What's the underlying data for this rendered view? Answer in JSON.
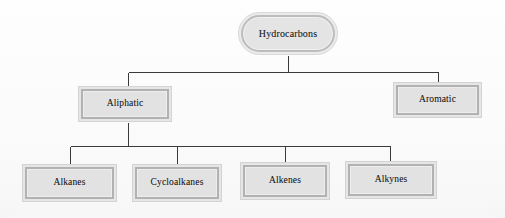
{
  "diagram": {
    "type": "tree",
    "colors": {
      "background": "#fdfdfd",
      "node_fill": "#e2e2e2",
      "node_border": "#b2b2b2",
      "node_outer_band": "#ededed",
      "connector": "#3a3a3a",
      "text": "#1d1d1d"
    },
    "root": {
      "label": "Hydrocarbons",
      "shape": "rounded-rectangle"
    },
    "level1": [
      {
        "label": "Aliphatic",
        "shape": "rectangle"
      },
      {
        "label": "Aromatic",
        "shape": "rectangle"
      }
    ],
    "level2": [
      {
        "label": "Alkanes",
        "shape": "rectangle"
      },
      {
        "label": "Cycloalkanes",
        "shape": "rectangle"
      },
      {
        "label": "Alkenes",
        "shape": "rectangle"
      },
      {
        "label": "Alkynes",
        "shape": "rectangle"
      }
    ],
    "edges": [
      {
        "from": "Hydrocarbons",
        "to": "Aliphatic"
      },
      {
        "from": "Hydrocarbons",
        "to": "Aromatic"
      },
      {
        "from": "Aliphatic",
        "to": "Alkanes"
      },
      {
        "from": "Aliphatic",
        "to": "Cycloalkanes"
      },
      {
        "from": "Aliphatic",
        "to": "Alkenes"
      },
      {
        "from": "Aliphatic",
        "to": "Alkynes"
      }
    ]
  }
}
